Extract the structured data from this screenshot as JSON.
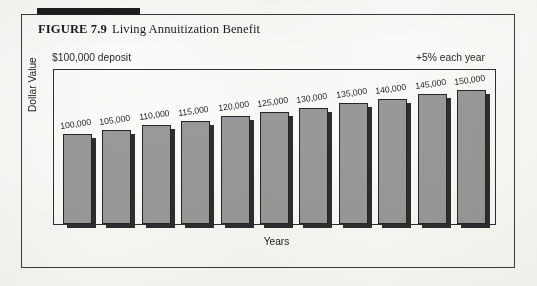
{
  "figure": {
    "number": "FIGURE 7.9",
    "title": "Living Annuitization Benefit"
  },
  "annotations": {
    "left": "$100,000 deposit",
    "right": "+5% each year"
  },
  "colors": {
    "bar_fill": "#9b9b9b",
    "bar_outline": "#262626",
    "bar_shadow": "#2e2e2e",
    "frame": "#2f2f2f",
    "rule": "#1d1d1d",
    "page": "#fdfdfc"
  },
  "chart_data": {
    "type": "bar",
    "title": "Living Annuitization Benefit",
    "xlabel": "Years",
    "ylabel": "Dollar Value",
    "grid": false,
    "legend": null,
    "ylim": [
      0,
      160000
    ],
    "annotations": [
      "$100,000 deposit",
      "+5% each year"
    ],
    "categories": [
      "1",
      "2",
      "3",
      "4",
      "5",
      "6",
      "7",
      "8",
      "9",
      "10",
      "11"
    ],
    "tick_labels": [],
    "data_labels": [
      "100,000",
      "105,000",
      "110,000",
      "115,000",
      "120,000",
      "125,000",
      "130,000",
      "135,000",
      "140,000",
      "145,000",
      "150,000"
    ],
    "values": [
      100000,
      105000,
      110000,
      115000,
      120000,
      125000,
      130000,
      135000,
      140000,
      145000,
      150000
    ]
  }
}
